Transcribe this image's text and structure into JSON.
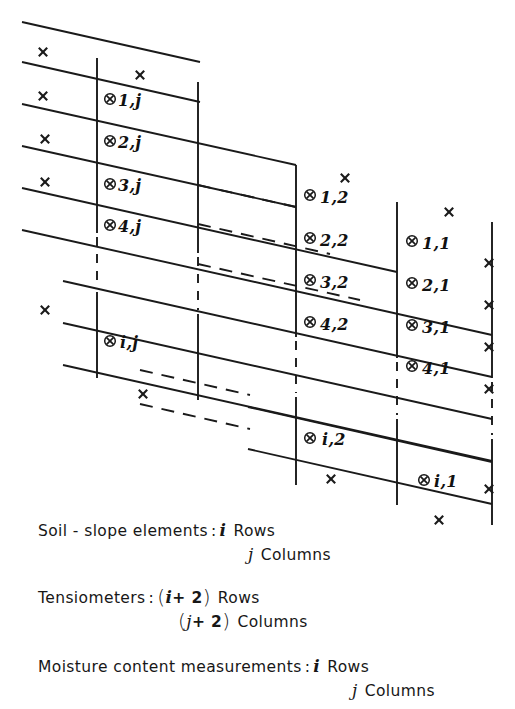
{
  "figure": {
    "type": "schematic-diagram",
    "title_visible": false
  },
  "symbols": {
    "measurement_point": "circled-x",
    "tensiometer": "x-mark"
  },
  "grid": {
    "rows_labeled": [
      "1",
      "2",
      "3",
      "4",
      "i"
    ],
    "columns_labeled": [
      "j",
      "2",
      "1"
    ],
    "cells": [
      {
        "id": "c-1j",
        "label": "1,j",
        "row": "1",
        "col": "j",
        "x": 118,
        "y": 98
      },
      {
        "id": "c-2j",
        "label": "2,j",
        "row": "2",
        "col": "j",
        "x": 118,
        "y": 140
      },
      {
        "id": "c-3j",
        "label": "3,j",
        "row": "3",
        "col": "j",
        "x": 118,
        "y": 183
      },
      {
        "id": "c-4j",
        "label": "4,j",
        "row": "4",
        "col": "j",
        "x": 118,
        "y": 224
      },
      {
        "id": "c-ij",
        "label": "i,j",
        "row": "i",
        "col": "j",
        "x": 118,
        "y": 340
      },
      {
        "id": "c-12",
        "label": "1,2",
        "row": "1",
        "col": "2",
        "x": 318,
        "y": 194
      },
      {
        "id": "c-22",
        "label": "2,2",
        "row": "2",
        "col": "2",
        "x": 318,
        "y": 237
      },
      {
        "id": "c-32",
        "label": "3,2",
        "row": "3",
        "col": "2",
        "x": 318,
        "y": 279
      },
      {
        "id": "c-42",
        "label": "4,2",
        "row": "4",
        "col": "2",
        "x": 318,
        "y": 321
      },
      {
        "id": "c-i2",
        "label": "i,2",
        "row": "i",
        "col": "2",
        "x": 318,
        "y": 437
      },
      {
        "id": "c-11",
        "label": "1,1",
        "row": "1",
        "col": "1",
        "x": 420,
        "y": 240
      },
      {
        "id": "c-21",
        "label": "2,1",
        "row": "2",
        "col": "1",
        "x": 420,
        "y": 282
      },
      {
        "id": "c-31",
        "label": "3,1",
        "row": "3",
        "col": "1",
        "x": 420,
        "y": 324
      },
      {
        "id": "c-41",
        "label": "4,1",
        "row": "4",
        "col": "1",
        "x": 420,
        "y": 365
      },
      {
        "id": "c-i1",
        "label": "i,1",
        "row": "i",
        "col": "1",
        "x": 430,
        "y": 479
      }
    ]
  },
  "legend": {
    "entries": [
      {
        "id": "soil-slope-elements",
        "label": "Soil - slope  elements",
        "colon": ":",
        "lines": [
          {
            "symbol": "i",
            "unit": "Rows"
          },
          {
            "symbol": "j",
            "unit": "Columns"
          }
        ]
      },
      {
        "id": "tensiometers",
        "label": "Tensiometers",
        "colon": ":",
        "lines": [
          {
            "symbol": "( i + 2 )",
            "unit": "Rows"
          },
          {
            "symbol": "( j + 2 )",
            "unit": "Columns"
          }
        ]
      },
      {
        "id": "moisture-content-measurements",
        "label": "Moisture  content  measurements",
        "colon": ":",
        "lines": [
          {
            "symbol": "i",
            "unit": "Rows"
          },
          {
            "symbol": "j",
            "unit": "Columns"
          }
        ]
      }
    ],
    "words": {
      "rows": "Rows",
      "columns": "Columns",
      "plus_two": "+ 2",
      "paren_open": "(",
      "paren_close": ")",
      "i": "i",
      "j": "j",
      "soil_slope": "Soil - slope  elements",
      "tensiometers": "Tensiometers",
      "moisture": "Moisture  content  measurements"
    }
  },
  "colors": {
    "line": "#1a1a1a",
    "text": "#141414",
    "background": "#ffffff"
  }
}
